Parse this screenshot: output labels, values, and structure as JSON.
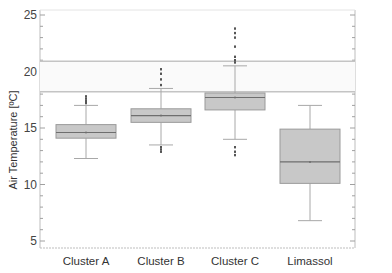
{
  "chart_data": {
    "type": "boxplot",
    "title": "",
    "xlabel": "",
    "ylabel": "Air Temperature [ºC]",
    "ylim": [
      4.2,
      25.8
    ],
    "yticks": [
      5,
      10,
      15,
      20,
      25
    ],
    "grid": false,
    "legend": null,
    "categories": [
      "Cluster A",
      "Cluster B",
      "Cluster C",
      "Limassol"
    ],
    "series": [
      {
        "name": "Cluster A",
        "whisker_low": 12.3,
        "q1": 14.1,
        "median": 14.6,
        "q3": 15.3,
        "whisker_high": 17.0,
        "outliers_high": [
          17.2,
          17.4,
          17.6,
          17.8
        ],
        "outliers_low": []
      },
      {
        "name": "Cluster B",
        "whisker_low": 13.5,
        "q1": 15.5,
        "median": 16.1,
        "q3": 16.7,
        "whisker_high": 18.5,
        "outliers_high": [
          18.8,
          19.3,
          19.8,
          20.2
        ],
        "outliers_low": [
          13.3,
          13.1,
          12.9
        ]
      },
      {
        "name": "Cluster C",
        "whisker_low": 14.0,
        "q1": 16.6,
        "median": 17.7,
        "q3": 18.1,
        "whisker_high": 20.5,
        "outliers_high": [
          20.8,
          21.0,
          21.3,
          22.2,
          23.0,
          23.4,
          23.8
        ],
        "outliers_low": [
          13.3,
          12.9,
          12.6
        ]
      },
      {
        "name": "Limassol",
        "whisker_low": 6.8,
        "q1": 10.1,
        "median": 12.0,
        "q3": 14.9,
        "whisker_high": 17.0,
        "outliers_high": [],
        "outliers_low": []
      }
    ],
    "reference_band": {
      "low": 18.2,
      "high": 20.9
    }
  },
  "colors": {
    "box_fill": "#c8c8c8",
    "box_stroke": "#9a9a9a",
    "median": "#6e6e6e",
    "whisker": "#a8a8a8",
    "outlier": "#555555",
    "band_line": "#c4c4c4",
    "axis": "#bdbdbd"
  }
}
